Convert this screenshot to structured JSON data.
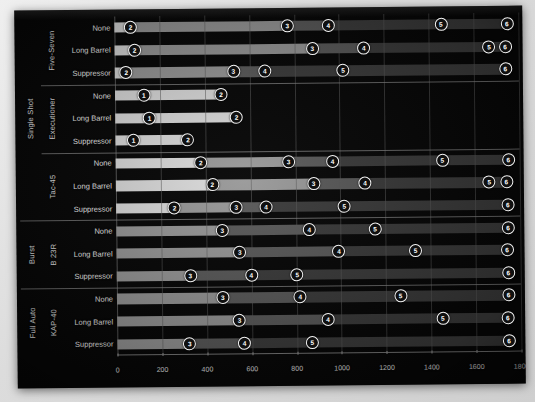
{
  "chart_data": {
    "type": "bar",
    "orientation": "horizontal",
    "title": "",
    "xlabel": "",
    "ylabel": "",
    "xlim": [
      0,
      1800
    ],
    "xticks": [
      0,
      200,
      400,
      600,
      800,
      1000,
      1200,
      1400,
      1600,
      1800
    ],
    "grid": true,
    "legend": "none",
    "marker_labels": [
      "1",
      "2",
      "3",
      "4",
      "5",
      "6"
    ],
    "group_levels": [
      "fire_mode",
      "weapon",
      "attachment"
    ],
    "groups": [
      {
        "fire_mode": "Single Shot",
        "weapons": [
          {
            "weapon": "Five-Seven",
            "rows": [
              {
                "attachment": "None",
                "markers": [
                  {
                    "label": "2",
                    "value": 72
                  },
                  {
                    "label": "3",
                    "value": 770
                  },
                  {
                    "label": "4",
                    "value": 953
                  },
                  {
                    "label": "5",
                    "value": 1455
                  },
                  {
                    "label": "6",
                    "value": 1749
                  }
                ]
              },
              {
                "attachment": "Long Barrel",
                "markers": [
                  {
                    "label": "2",
                    "value": 89
                  },
                  {
                    "label": "3",
                    "value": 881
                  },
                  {
                    "label": "4",
                    "value": 1110
                  },
                  {
                    "label": "5",
                    "value": 1668
                  },
                  {
                    "label": "6",
                    "value": 1740
                  }
                ]
              },
              {
                "attachment": "Suppressor",
                "markers": [
                  {
                    "label": "2",
                    "value": 51
                  },
                  {
                    "label": "3",
                    "value": 528
                  },
                  {
                    "label": "4",
                    "value": 668
                  },
                  {
                    "label": "5",
                    "value": 1017
                  },
                  {
                    "label": "6",
                    "value": 1740
                  }
                ]
              }
            ]
          },
          {
            "weapon": "Executioner",
            "rows": [
              {
                "attachment": "None",
                "markers": [
                  {
                    "label": "1",
                    "value": 128
                  },
                  {
                    "label": "2",
                    "value": 472
                  }
                ]
              },
              {
                "attachment": "Long Barrel",
                "markers": [
                  {
                    "label": "1",
                    "value": 153
                  },
                  {
                    "label": "2",
                    "value": 540
                  }
                ]
              },
              {
                "attachment": "Suppressor",
                "markers": [
                  {
                    "label": "1",
                    "value": 81
                  },
                  {
                    "label": "2",
                    "value": 323
                  }
                ]
              }
            ]
          },
          {
            "weapon": "Tac-45",
            "rows": [
              {
                "attachment": "None",
                "markers": [
                  {
                    "label": "2",
                    "value": 379
                  },
                  {
                    "label": "3",
                    "value": 770
                  },
                  {
                    "label": "4",
                    "value": 966
                  },
                  {
                    "label": "5",
                    "value": 1455
                  },
                  {
                    "label": "6",
                    "value": 1749
                  }
                ]
              },
              {
                "attachment": "Long Barrel",
                "markers": [
                  {
                    "label": "2",
                    "value": 430
                  },
                  {
                    "label": "3",
                    "value": 881
                  },
                  {
                    "label": "4",
                    "value": 1110
                  },
                  {
                    "label": "5",
                    "value": 1664
                  },
                  {
                    "label": "6",
                    "value": 1740
                  }
                ]
              },
              {
                "attachment": "Suppressor",
                "markers": [
                  {
                    "label": "2",
                    "value": 260
                  },
                  {
                    "label": "3",
                    "value": 536
                  },
                  {
                    "label": "4",
                    "value": 668
                  },
                  {
                    "label": "5",
                    "value": 1017
                  },
                  {
                    "label": "6",
                    "value": 1745
                  }
                ]
              }
            ]
          }
        ]
      },
      {
        "fire_mode": "Burst",
        "weapons": [
          {
            "weapon": "B 23R",
            "rows": [
              {
                "attachment": "None",
                "markers": [
                  {
                    "label": "3",
                    "value": 472
                  },
                  {
                    "label": "4",
                    "value": 860
                  },
                  {
                    "label": "5",
                    "value": 1153
                  },
                  {
                    "label": "6",
                    "value": 1745
                  }
                ]
              },
              {
                "attachment": "Long Barrel",
                "markers": [
                  {
                    "label": "3",
                    "value": 549
                  },
                  {
                    "label": "4",
                    "value": 991
                  },
                  {
                    "label": "5",
                    "value": 1332
                  },
                  {
                    "label": "6",
                    "value": 1740
                  }
                ]
              },
              {
                "attachment": "Suppressor",
                "markers": [
                  {
                    "label": "3",
                    "value": 328
                  },
                  {
                    "label": "4",
                    "value": 600
                  },
                  {
                    "label": "5",
                    "value": 804
                  },
                  {
                    "label": "6",
                    "value": 1745
                  }
                ]
              }
            ]
          }
        ]
      },
      {
        "fire_mode": "Full Auto",
        "weapons": [
          {
            "weapon": "KAP-40",
            "rows": [
              {
                "attachment": "None",
                "markers": [
                  {
                    "label": "3",
                    "value": 472
                  },
                  {
                    "label": "4",
                    "value": 817
                  },
                  {
                    "label": "5",
                    "value": 1264
                  },
                  {
                    "label": "6",
                    "value": 1745
                  }
                ]
              },
              {
                "attachment": "Long Barrel",
                "markers": [
                  {
                    "label": "3",
                    "value": 545
                  },
                  {
                    "label": "4",
                    "value": 940
                  },
                  {
                    "label": "5",
                    "value": 1451
                  },
                  {
                    "label": "6",
                    "value": 1740
                  }
                ]
              },
              {
                "attachment": "Suppressor",
                "markers": [
                  {
                    "label": "3",
                    "value": 323
                  },
                  {
                    "label": "4",
                    "value": 566
                  },
                  {
                    "label": "5",
                    "value": 868
                  },
                  {
                    "label": "6",
                    "value": 1745
                  }
                ]
              }
            ]
          }
        ]
      }
    ],
    "colors": {
      "background": "#070707",
      "bar_light": "#dcdcdc",
      "bar_mid": "#9a9a9a",
      "bar_dark": "#5c5c5c",
      "bar_darker": "#3d3d3d",
      "gridline": "#5e5e5e",
      "text": "#eeeeee",
      "marker_fill": "#101010",
      "marker_ring": "#f3f3f3"
    }
  }
}
